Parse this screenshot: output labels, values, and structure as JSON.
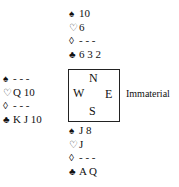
{
  "compass": {
    "north": "N",
    "west": "W",
    "east": "E",
    "south": "S"
  },
  "suit_symbols": {
    "spades": "♠",
    "hearts": "♡",
    "diamonds": "◊",
    "clubs": "♣"
  },
  "hands": {
    "north": {
      "spades": "10",
      "hearts": "6",
      "diamonds": "- - -",
      "clubs": "6 3 2"
    },
    "west": {
      "spades": "- - -",
      "hearts": "Q 10",
      "diamonds": "- - -",
      "clubs": "K J 10"
    },
    "south": {
      "spades": "J 8",
      "hearts": "J",
      "diamonds": "- - -",
      "clubs": "A Q"
    },
    "east": {
      "label": "Immaterial"
    }
  }
}
